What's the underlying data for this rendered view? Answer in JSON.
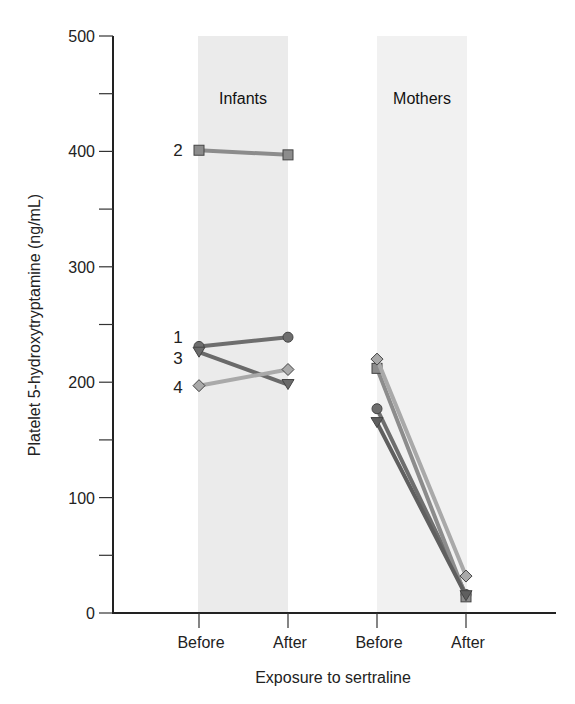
{
  "chart_data": {
    "type": "line",
    "title": "",
    "xlabel": "Exposure to sertraline",
    "ylabel": "Platelet 5-hydroxytryptamine (ng/mL)",
    "ylim": [
      0,
      500
    ],
    "yticks": [
      0,
      100,
      200,
      300,
      400,
      500
    ],
    "grid": false,
    "categories": [
      "Before",
      "After",
      "Before",
      "After"
    ],
    "groups": [
      {
        "name": "Infants",
        "series": [
          {
            "name": "1",
            "marker": "circle",
            "color": "#6e6e6e",
            "values": [
              231,
              239
            ]
          },
          {
            "name": "2",
            "marker": "square",
            "color": "#8c8c8c",
            "values": [
              401,
              397
            ]
          },
          {
            "name": "3",
            "marker": "triangle-down",
            "color": "#6a6a6a",
            "values": [
              226,
              198
            ]
          },
          {
            "name": "4",
            "marker": "diamond",
            "color": "#a9a9a9",
            "values": [
              197,
              211
            ]
          }
        ]
      },
      {
        "name": "Mothers",
        "series": [
          {
            "name": "1",
            "marker": "circle",
            "color": "#6e6e6e",
            "values": [
              177,
              16
            ]
          },
          {
            "name": "2",
            "marker": "square",
            "color": "#8c8c8c",
            "values": [
              212,
              14
            ]
          },
          {
            "name": "3",
            "marker": "triangle-down",
            "color": "#5f5f5f",
            "values": [
              165,
              15
            ]
          },
          {
            "name": "4",
            "marker": "diamond",
            "color": "#a9a9a9",
            "values": [
              220,
              32
            ]
          }
        ]
      }
    ]
  },
  "labels": {
    "infants": "Infants",
    "mothers": "Mothers",
    "xlabel": "Exposure to sertraline",
    "ylabel": "Platelet 5-hydroxytryptamine (ng/mL)",
    "ticks": [
      "0",
      "100",
      "200",
      "300",
      "400",
      "500"
    ],
    "categories": [
      "Before",
      "After",
      "Before",
      "After"
    ]
  }
}
